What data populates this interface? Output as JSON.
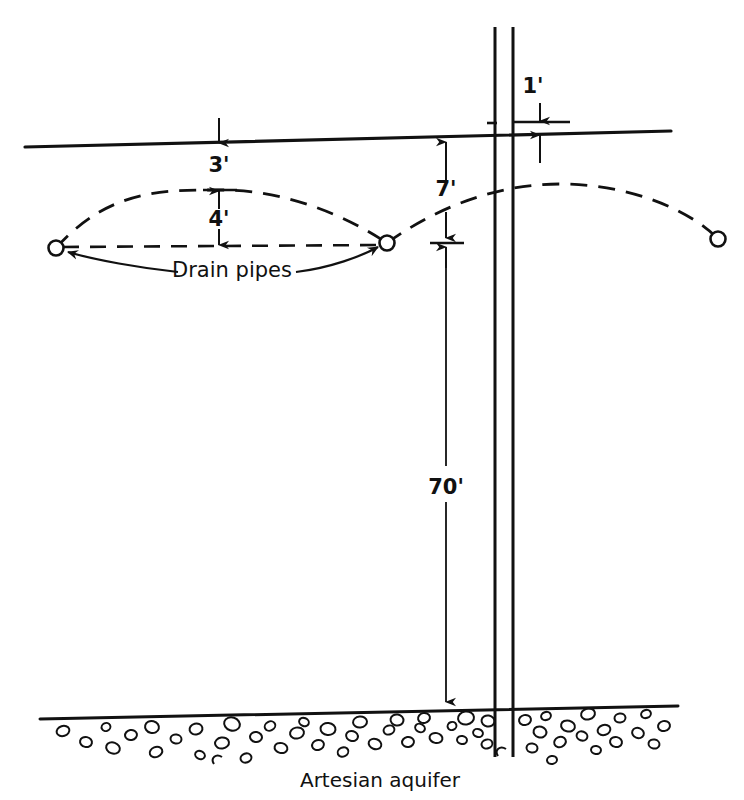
{
  "figure": {
    "kind": "engineering-cross-section",
    "stroke_color": "#111111",
    "background_color": "#ffffff"
  },
  "labels": {
    "depth_to_drain_from_ground": "3'",
    "mound_height_between_drains": "4'",
    "artesian_head_above_drain_level": "7'",
    "well_stickup_above_ground": "1'",
    "depth_to_aquifer": "70'",
    "drain_pipes": "Drain pipes",
    "artesian_aquifer": "Artesian aquifer"
  },
  "dimensions": [
    {
      "name": "3-feet",
      "value": "3'",
      "x": 219,
      "y": 172
    },
    {
      "name": "4-feet",
      "value": "4'",
      "x": 219,
      "y": 226
    },
    {
      "name": "7-feet",
      "value": "7'",
      "x": 446,
      "y": 196
    },
    {
      "name": "1-foot",
      "value": "1'",
      "x": 533,
      "y": 93
    },
    {
      "name": "70-feet",
      "value": "70'",
      "x": 446,
      "y": 487
    }
  ],
  "annotations": [
    {
      "name": "drain-pipes-callout",
      "text": "Drain pipes",
      "x": 232,
      "y": 277
    },
    {
      "name": "artesian-aquifer-caption",
      "text": "Artesian aquifer",
      "x": 380,
      "y": 787
    }
  ],
  "geometry": {
    "ground_line": {
      "x1": 25,
      "y1": 147,
      "x2": 671,
      "y2": 131
    },
    "aquifer_line": {
      "x1": 40,
      "y1": 719,
      "x2": 678,
      "y2": 706
    },
    "well_casing_left_x": 495,
    "well_casing_right_x": 513,
    "well_casing_top_y": 27,
    "well_casing_bottom_y": 757,
    "drain_pipe_left": {
      "cx": 56,
      "cy": 248,
      "r": 7
    },
    "drain_pipe_right": {
      "cx": 387,
      "cy": 243,
      "r": 7
    },
    "observation_point_right": {
      "cx": 718,
      "cy": 239,
      "r": 7
    }
  },
  "water_table": {
    "style": "dashed",
    "left_mound_peak": {
      "x": 221,
      "y": 190
    },
    "right_mound_peak": {
      "x": 560,
      "y": 184
    },
    "drain_level_line_y": 246
  }
}
